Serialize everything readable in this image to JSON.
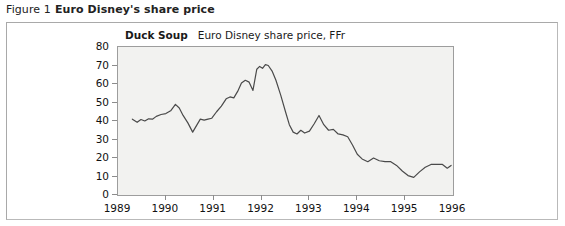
{
  "caption": {
    "label": "Figure 1",
    "title": "Euro Disney's share price"
  },
  "chart_data": {
    "type": "line",
    "title": "Duck Soup",
    "subtitle": "Euro Disney share price, FFr",
    "xlabel": "",
    "ylabel": "",
    "ylim": [
      0,
      80
    ],
    "xlim": [
      1989.0,
      1996.0
    ],
    "yticks": [
      0,
      10,
      20,
      30,
      40,
      50,
      60,
      70,
      80
    ],
    "xticks": [
      1989,
      1990,
      1991,
      1992,
      1993,
      1994,
      1995,
      1996
    ],
    "grid": false,
    "legend": "none",
    "series": [
      {
        "name": "Euro Disney share price, FFr",
        "color": "#4a4a4a",
        "x": [
          1989.3,
          1989.4,
          1989.48,
          1989.56,
          1989.64,
          1989.72,
          1989.8,
          1989.9,
          1990.0,
          1990.1,
          1990.2,
          1990.28,
          1990.36,
          1990.46,
          1990.56,
          1990.64,
          1990.72,
          1990.8,
          1990.88,
          1990.96,
          1991.06,
          1991.16,
          1991.26,
          1991.34,
          1991.42,
          1991.5,
          1991.58,
          1991.66,
          1991.74,
          1991.82,
          1991.9,
          1991.96,
          1992.02,
          1992.08,
          1992.14,
          1992.22,
          1992.3,
          1992.4,
          1992.5,
          1992.58,
          1992.66,
          1992.74,
          1992.82,
          1992.9,
          1993.0,
          1993.1,
          1993.2,
          1993.3,
          1993.4,
          1993.5,
          1993.6,
          1993.7,
          1993.8,
          1993.9,
          1994.0,
          1994.1,
          1994.22,
          1994.34,
          1994.46,
          1994.58,
          1994.7,
          1994.82,
          1994.94,
          1995.06,
          1995.18,
          1995.3,
          1995.42,
          1995.54,
          1995.66,
          1995.78,
          1995.88,
          1995.96
        ],
        "y": [
          41.0,
          39.3,
          40.8,
          40.0,
          41.2,
          41.0,
          42.5,
          43.5,
          44.0,
          45.5,
          49.0,
          47.0,
          43.0,
          39.0,
          34.0,
          37.5,
          41.0,
          40.5,
          41.0,
          41.5,
          45.0,
          48.0,
          52.0,
          53.0,
          52.5,
          56.0,
          60.5,
          62.0,
          61.0,
          56.5,
          68.0,
          69.5,
          68.5,
          70.5,
          70.0,
          67.0,
          62.0,
          54.0,
          45.0,
          38.0,
          34.0,
          33.0,
          35.0,
          33.5,
          34.5,
          38.5,
          43.0,
          38.0,
          35.0,
          35.5,
          33.0,
          32.5,
          31.5,
          27.0,
          22.0,
          19.5,
          18.0,
          20.0,
          18.5,
          18.0,
          18.0,
          16.0,
          13.0,
          10.5,
          9.5,
          12.5,
          15.0,
          16.5,
          16.5,
          16.5,
          14.5,
          16.0
        ]
      }
    ]
  }
}
